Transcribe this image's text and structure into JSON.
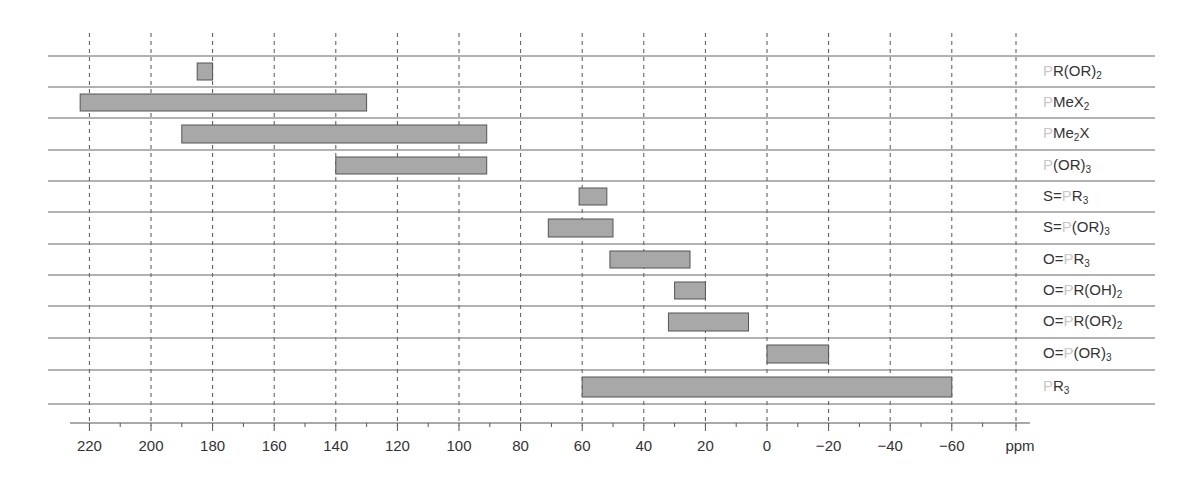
{
  "chart_data": {
    "type": "bar",
    "orientation": "horizontal-range",
    "title": "",
    "xlabel": "ppm",
    "ylabel": "",
    "xlim": [
      225,
      -72
    ],
    "x_reversed": true,
    "grid": {
      "vertical_dashed": true,
      "horizontal_row_separators": true
    },
    "xticks": [
      220,
      200,
      180,
      160,
      140,
      120,
      100,
      80,
      60,
      40,
      20,
      0,
      -20,
      -40,
      -60
    ],
    "xtick_labels": [
      "220",
      "200",
      "180",
      "160",
      "140",
      "120",
      "100",
      "80",
      "60",
      "40",
      "20",
      "0",
      "−20",
      "−40",
      "−60"
    ],
    "unit_label": "ppm",
    "bar_color": "#a8a8a8",
    "bar_edge_color": "#555555",
    "highlight_atom_color": "#c8c8c8",
    "categories": [
      "PR(OR)2",
      "PMeX2",
      "PMe2X",
      "P(OR)3",
      "S=PR3",
      "S=P(OR)3",
      "O=PR3",
      "O=PR(OH)2",
      "O=PR(OR)2",
      "O=P(OR)3",
      "PR3"
    ],
    "series": [
      {
        "name": "31P chemical shift range",
        "ranges": [
          {
            "label": "PR(OR)2",
            "from": 185,
            "to": 180
          },
          {
            "label": "PMeX2",
            "from": 223,
            "to": 130
          },
          {
            "label": "PMe2X",
            "from": 190,
            "to": 91
          },
          {
            "label": "P(OR)3",
            "from": 140,
            "to": 91
          },
          {
            "label": "S=PR3",
            "from": 61,
            "to": 52
          },
          {
            "label": "S=P(OR)3",
            "from": 71,
            "to": 50
          },
          {
            "label": "O=PR3",
            "from": 51,
            "to": 25
          },
          {
            "label": "O=PR(OH)2",
            "from": 30,
            "to": 20
          },
          {
            "label": "O=PR(OR)2",
            "from": 32,
            "to": 6
          },
          {
            "label": "O=P(OR)3",
            "from": 0,
            "to": -20
          },
          {
            "label": "PR3",
            "from": 60,
            "to": -60
          }
        ]
      }
    ],
    "row_labels": [
      {
        "pre": "",
        "p": "P",
        "post": "R(OR)",
        "sub": "2",
        "tail": ""
      },
      {
        "pre": "",
        "p": "P",
        "post": "MeX",
        "sub": "2",
        "tail": ""
      },
      {
        "pre": "",
        "p": "P",
        "post": "Me",
        "sub": "2",
        "tail": "X"
      },
      {
        "pre": "",
        "p": "P",
        "post": "(OR)",
        "sub": "3",
        "tail": ""
      },
      {
        "pre": "S=",
        "p": "P",
        "post": "R",
        "sub": "3",
        "tail": ""
      },
      {
        "pre": "S=",
        "p": "P",
        "post": "(OR)",
        "sub": "3",
        "tail": ""
      },
      {
        "pre": "O=",
        "p": "P",
        "post": "R",
        "sub": "3",
        "tail": ""
      },
      {
        "pre": "O=",
        "p": "P",
        "post": "R(OH)",
        "sub": "2",
        "tail": ""
      },
      {
        "pre": "O=",
        "p": "P",
        "post": "R(OR)",
        "sub": "2",
        "tail": ""
      },
      {
        "pre": "O=",
        "p": "P",
        "post": "(OR)",
        "sub": "3",
        "tail": ""
      },
      {
        "pre": "",
        "p": "P",
        "post": "R",
        "sub": "3",
        "tail": ""
      }
    ]
  }
}
